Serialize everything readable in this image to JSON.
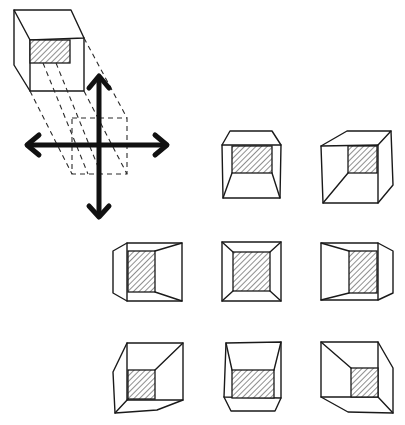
{
  "diagram": {
    "colors": {
      "ink": "#1a1a1a",
      "background": "#ffffff",
      "hatch": "#333333"
    },
    "elements": {
      "source_box": {
        "label": "source-box-perspective"
      },
      "movement_cross": {
        "label": "four-way-arrows",
        "directions": [
          "up",
          "down",
          "left",
          "right"
        ]
      },
      "grid": {
        "rows": 3,
        "cols": 3,
        "views": [
          {
            "id": "top-center",
            "row": 0,
            "col": 1
          },
          {
            "id": "top-right",
            "row": 0,
            "col": 2
          },
          {
            "id": "middle-left",
            "row": 1,
            "col": 0
          },
          {
            "id": "middle-center",
            "row": 1,
            "col": 1
          },
          {
            "id": "middle-right",
            "row": 1,
            "col": 2
          },
          {
            "id": "bottom-left",
            "row": 2,
            "col": 0
          },
          {
            "id": "bottom-center",
            "row": 2,
            "col": 1
          },
          {
            "id": "bottom-right",
            "row": 2,
            "col": 2
          }
        ]
      }
    }
  }
}
